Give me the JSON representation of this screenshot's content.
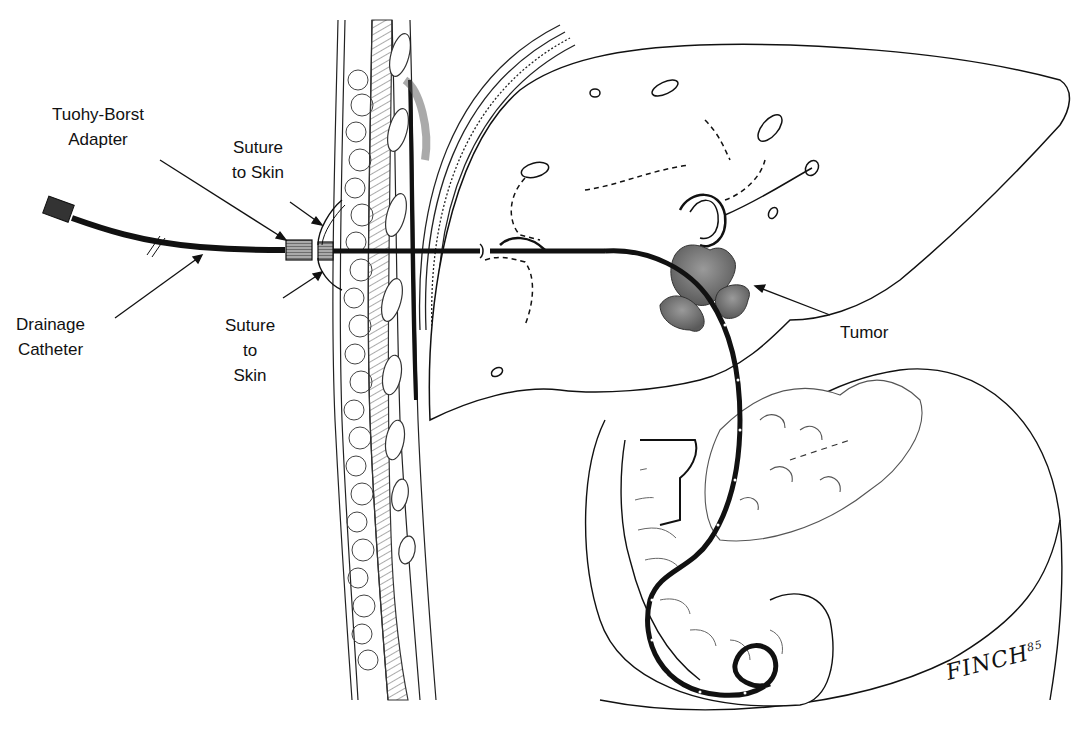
{
  "figure": {
    "type": "medical-illustration",
    "colors": {
      "ink": "#111111",
      "tumor": "#7a7a7a",
      "background": "#ffffff"
    }
  },
  "labels": {
    "tuohy_borst": {
      "line1": "Tuohy-Borst",
      "line2": "Adapter"
    },
    "suture_top": {
      "line1": "Suture",
      "line2": "to Skin"
    },
    "drainage_catheter": {
      "line1": "Drainage",
      "line2": "Catheter"
    },
    "suture_bottom": {
      "line1": "Suture",
      "line2": "to",
      "line3": "Skin"
    },
    "tumor": {
      "line1": "Tumor"
    }
  },
  "signature": {
    "name": "FINCH",
    "year": "85"
  }
}
